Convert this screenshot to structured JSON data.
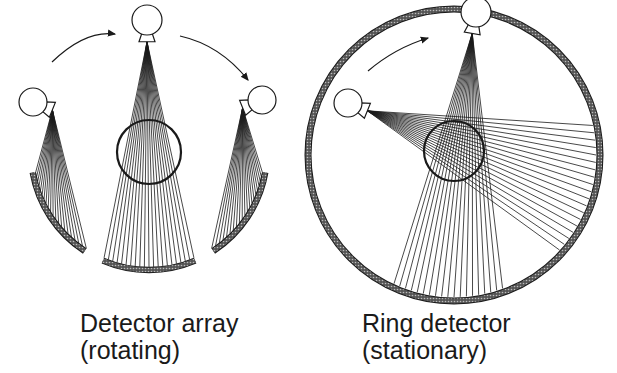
{
  "panels": [
    {
      "id": "rotating",
      "caption_line1": "Detector array",
      "caption_line2": "(rotating)",
      "tubes": 3,
      "detector": "arc array"
    },
    {
      "id": "stationary",
      "caption_line1": "Ring detector",
      "caption_line2": "(stationary)",
      "tubes": 2,
      "detector": "full ring"
    }
  ],
  "colors": {
    "line": "#1a1a1a",
    "background": "#ffffff"
  }
}
